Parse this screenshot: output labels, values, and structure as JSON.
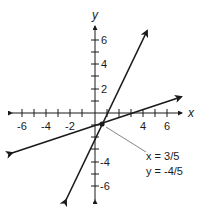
{
  "graph": {
    "axes": {
      "x_label": "x",
      "y_label": "y",
      "x_range": [
        -7,
        7
      ],
      "y_range": [
        -7,
        7
      ],
      "tick_step": 1,
      "x_tick_labels": [
        "-6",
        "-4",
        "-2",
        "4",
        "6"
      ],
      "y_tick_labels": [
        "6",
        "4",
        "2",
        "-4",
        "-6"
      ]
    },
    "lines": [
      {
        "name": "steep-line",
        "description": "line with positive steep slope through intersection"
      },
      {
        "name": "shallow-line",
        "description": "line with positive shallow slope through intersection"
      }
    ],
    "intersection": {
      "x": "3/5",
      "y": "-4/5",
      "label_x": "x = 3/5",
      "label_y": "y = -4/5"
    },
    "colors": {
      "stroke": "#1a1a1a",
      "leader": "#777777",
      "background": "#ffffff"
    }
  }
}
